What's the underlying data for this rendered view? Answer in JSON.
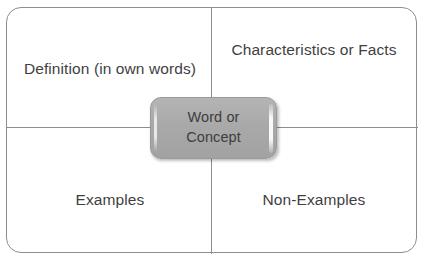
{
  "diagram": {
    "type": "frayer-model",
    "colors": {
      "background": "#ffffff",
      "frame_border": "#8d8d8d",
      "divider": "#8d8d8d",
      "center_box_fill": "#a9a9a9",
      "center_box_border": "#9a9a9a",
      "text": "#3f3f3f"
    },
    "center": {
      "label": "Word or Concept",
      "line1": "Word or",
      "line2": "Concept"
    },
    "quadrants": [
      {
        "id": "definition",
        "position": "top-left",
        "label": "Definition (in own words)"
      },
      {
        "id": "characteristics",
        "position": "top-right",
        "label": "Characteristics or Facts"
      },
      {
        "id": "examples",
        "position": "bottom-left",
        "label": "Examples"
      },
      {
        "id": "non-examples",
        "position": "bottom-right",
        "label": "Non-Examples"
      }
    ]
  }
}
